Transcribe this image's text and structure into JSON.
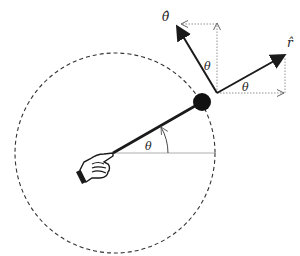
{
  "diagram": {
    "labels": {
      "theta_hat": "θ̂",
      "r_hat": "r̂",
      "theta_center": "θ",
      "theta_upper": "θ",
      "theta_right": "θ"
    },
    "colors": {
      "stroke": "#1a1a1a",
      "dotted": "#888888",
      "background": "#ffffff"
    },
    "geometry": {
      "circle_center": [
        115,
        153
      ],
      "circle_radius": 100,
      "mass_position": [
        202,
        102
      ],
      "vector_origin": [
        217,
        93
      ],
      "r_hat_tip": [
        285,
        55
      ],
      "theta_hat_tip": [
        176,
        25
      ]
    }
  }
}
